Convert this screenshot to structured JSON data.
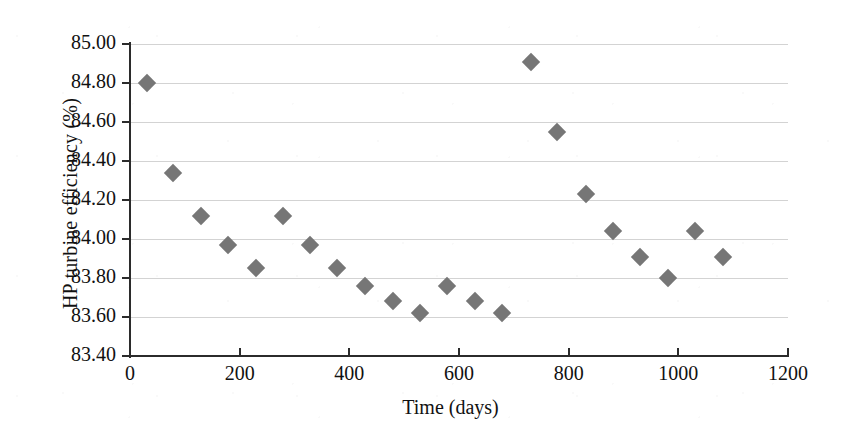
{
  "chart_data": {
    "type": "scatter",
    "title": "",
    "xlabel": "Time (days)",
    "ylabel": "HP turbine efficiency (%)",
    "xlim": [
      0,
      1200
    ],
    "ylim": [
      83.4,
      85.0
    ],
    "xticks": [
      "0",
      "200",
      "400",
      "600",
      "800",
      "1000",
      "1200"
    ],
    "xtick_values": [
      0,
      200,
      400,
      600,
      800,
      1000,
      1200
    ],
    "yticks": [
      "83.40",
      "83.60",
      "83.80",
      "84.00",
      "84.20",
      "84.40",
      "84.60",
      "84.80",
      "85.00"
    ],
    "ytick_values": [
      83.4,
      83.6,
      83.8,
      84.0,
      84.2,
      84.4,
      84.6,
      84.8,
      85.0
    ],
    "grid": "horizontal",
    "legend": "none",
    "marker": "diamond",
    "marker_color": "#767676",
    "x": [
      31,
      78,
      129,
      179,
      230,
      279,
      328,
      378,
      429,
      479,
      529,
      578,
      629,
      679,
      731,
      778,
      832,
      881,
      930,
      981,
      1031,
      1082
    ],
    "y": [
      84.8,
      84.34,
      84.12,
      83.97,
      83.85,
      84.12,
      83.97,
      83.85,
      83.76,
      83.68,
      83.62,
      83.76,
      83.68,
      83.62,
      84.91,
      84.55,
      84.23,
      84.04,
      83.91,
      83.8,
      84.04,
      83.91
    ]
  }
}
